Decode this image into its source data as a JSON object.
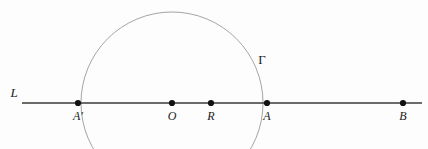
{
  "figure": {
    "background_color": "#fdfdfd",
    "line_color": "#3a3a3a",
    "circle_color": "#9a9a9a",
    "point_color": "#111111",
    "label_color": "#1a1a1a",
    "width": 428,
    "height": 149
  },
  "line": {
    "name": "L",
    "label": "L",
    "label_x": 14,
    "label_y": 97,
    "x1": 22,
    "y1": 103,
    "x2": 422,
    "y2": 103
  },
  "circle": {
    "name": "Gamma",
    "label": "Γ",
    "label_x": 262,
    "label_y": 64,
    "center_x": 172,
    "center_y": 103,
    "radius": 91
  },
  "points": [
    {
      "id": "A-prime",
      "label": "A′",
      "x": 78,
      "y": 103,
      "label_x": 78,
      "label_y": 120
    },
    {
      "id": "O",
      "label": "O",
      "x": 172,
      "y": 103,
      "label_x": 172,
      "label_y": 120
    },
    {
      "id": "R",
      "label": "R",
      "x": 211,
      "y": 103,
      "label_x": 211,
      "label_y": 120
    },
    {
      "id": "A",
      "label": "A",
      "x": 267,
      "y": 103,
      "label_x": 267,
      "label_y": 120
    },
    {
      "id": "B",
      "label": "B",
      "x": 403,
      "y": 103,
      "label_x": 403,
      "label_y": 120
    }
  ]
}
